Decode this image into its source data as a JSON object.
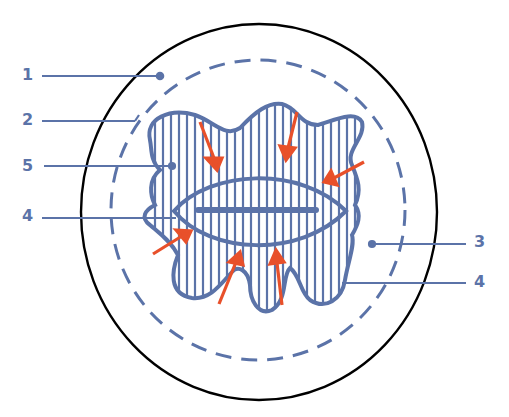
{
  "colors": {
    "outline": "#000000",
    "structure": "#5b73a8",
    "arrow": "#e8502a",
    "background": "#ffffff"
  },
  "labels": {
    "left": [
      {
        "text": "1",
        "x": 22,
        "y": 67
      },
      {
        "text": "2",
        "x": 22,
        "y": 112
      },
      {
        "text": "5",
        "x": 22,
        "y": 158
      },
      {
        "text": "4",
        "x": 22,
        "y": 208
      }
    ],
    "right": [
      {
        "text": "3",
        "x": 474,
        "y": 234
      },
      {
        "text": "4",
        "x": 474,
        "y": 274
      }
    ]
  },
  "elements": {
    "outer_circle": "outer-boundary",
    "dashed_circle": "dashed-boundary",
    "blob": "irregular-striated-mass",
    "ellipse": "central-lens-structure",
    "arrows_count": 7
  }
}
